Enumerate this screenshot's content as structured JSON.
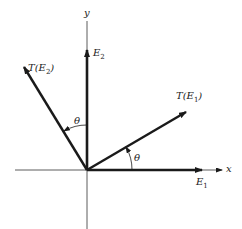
{
  "diagram": {
    "axes": {
      "x_label": "x",
      "y_label": "y"
    },
    "vectors": [
      {
        "name": "E1",
        "label_main": "E",
        "label_sub": "1"
      },
      {
        "name": "E2",
        "label_main": "E",
        "label_sub": "2"
      },
      {
        "name": "T(E1)",
        "label_pre": "T(E",
        "label_sub": "1",
        "label_post": ")"
      },
      {
        "name": "T(E2)",
        "label_pre": "T(E",
        "label_sub": "2",
        "label_post": ")"
      }
    ],
    "angles": [
      {
        "between": "E1 and T(E1)",
        "label": "θ"
      },
      {
        "between": "E2 and T(E2)",
        "label": "θ"
      }
    ],
    "colors": {
      "line": "#1a1a1a",
      "background": "#ffffff"
    }
  }
}
